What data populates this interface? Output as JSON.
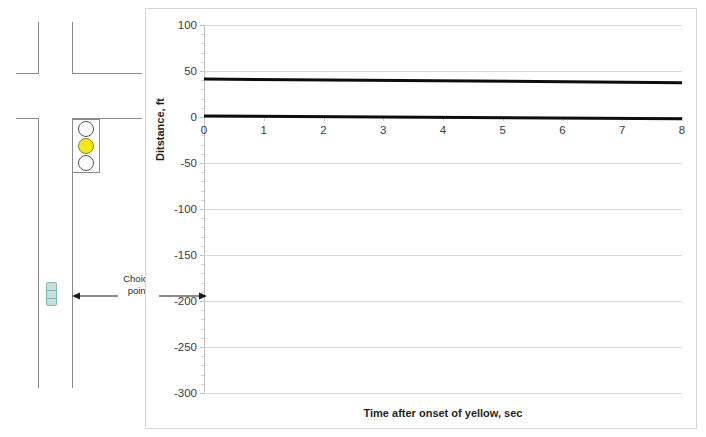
{
  "diagram": {
    "signal": {
      "name": "traffic-signal",
      "lamps": [
        {
          "color": "#ffffff",
          "state": "off",
          "aspect": "red"
        },
        {
          "color": "#f2e61c",
          "state": "on",
          "aspect": "yellow"
        },
        {
          "color": "#ffffff",
          "state": "off",
          "aspect": "green"
        }
      ]
    },
    "vehicle": {
      "name": "car",
      "color": "#bfe3dc"
    },
    "annotation": {
      "label_line1": "Choice",
      "label_line2": "point"
    }
  },
  "chart_data": {
    "type": "line",
    "title": "",
    "xlabel": "Time after onset of yellow, sec",
    "ylabel": "Ditstance, ft",
    "xlim": [
      0,
      8
    ],
    "ylim": [
      -300,
      100
    ],
    "grid": true,
    "legend": "none",
    "xticks": [
      0,
      1,
      2,
      3,
      4,
      5,
      6,
      7,
      8
    ],
    "xtick_labels": [
      "0",
      "1",
      "2",
      "3",
      "4",
      "5",
      "6",
      "7",
      "8"
    ],
    "yticks": [
      100,
      50,
      0,
      -50,
      -100,
      -150,
      -200,
      -250,
      -300
    ],
    "ytick_labels": [
      "100",
      "50",
      "0",
      "-50",
      "-100",
      "-150",
      "-200",
      "-250",
      "-300"
    ],
    "y_minor_tick_count": 5,
    "series": [
      {
        "name": "upper-boundary",
        "color": "#0d0d0d",
        "width": 3,
        "x": [
          0,
          8
        ],
        "values": [
          41,
          37
        ]
      },
      {
        "name": "lower-boundary",
        "color": "#0d0d0d",
        "width": 3,
        "x": [
          0,
          8
        ],
        "values": [
          1,
          -2
        ]
      }
    ]
  }
}
